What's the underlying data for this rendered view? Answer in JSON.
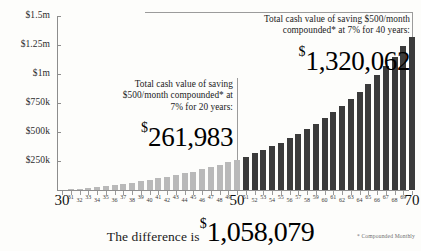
{
  "chart_data": {
    "type": "bar",
    "title": "",
    "xlabel": "Age",
    "ylabel": "",
    "ylim": [
      0,
      1500000
    ],
    "grid": false,
    "legend": "none",
    "y_ticks": [
      {
        "value": 1500000,
        "label": "$1.5m"
      },
      {
        "value": 1250000,
        "label": "$1.25m"
      },
      {
        "value": 1000000,
        "label": "$1m"
      },
      {
        "value": 750000,
        "label": "$750k"
      },
      {
        "value": 500000,
        "label": "$500k"
      },
      {
        "value": 250000,
        "label": "$250k"
      }
    ],
    "categories": [
      30,
      31,
      32,
      33,
      34,
      35,
      36,
      37,
      38,
      39,
      40,
      41,
      42,
      43,
      44,
      45,
      46,
      47,
      48,
      49,
      50,
      51,
      52,
      53,
      54,
      55,
      56,
      57,
      58,
      59,
      60,
      61,
      62,
      63,
      64,
      65,
      66,
      67,
      68,
      69,
      70
    ],
    "major_x_labels": [
      "30",
      "50",
      "70"
    ],
    "values": [
      0,
      6220,
      12890,
      20040,
      27710,
      35930,
      44750,
      54200,
      64340,
      75210,
      86870,
      99370,
      112780,
      127160,
      142580,
      159120,
      176860,
      195880,
      216280,
      238160,
      261983,
      287480,
      314830,
      344160,
      375610,
      409340,
      445510,
      484310,
      525920,
      570550,
      618420,
      669760,
      724830,
      783890,
      847240,
      915180,
      988050,
      1066200,
      1150030,
      1239960,
      1320062
    ],
    "series_split_age": 50,
    "colors": {
      "bar_early": "#b9b9b9",
      "bar_late": "#3b3b3b",
      "axis": "#8d8d8d",
      "background": "#fdfdfb",
      "text": "#1a1a1a"
    }
  },
  "callout_top": {
    "line1": "Total cash value of saving $500/month",
    "line2": "compounded* at 7% for 40 years:",
    "currency": "$",
    "amount": "1,320,062"
  },
  "callout_mid": {
    "line1": "Total cash value of saving",
    "line2": "$500/month compounded* at",
    "line3": "7% for 20 years:",
    "currency": "$",
    "amount": "261,983"
  },
  "footer": {
    "difference_label": "The difference is",
    "currency": "$",
    "difference_amount": "1,058,079",
    "footnote": "* Compounded Monthly"
  }
}
